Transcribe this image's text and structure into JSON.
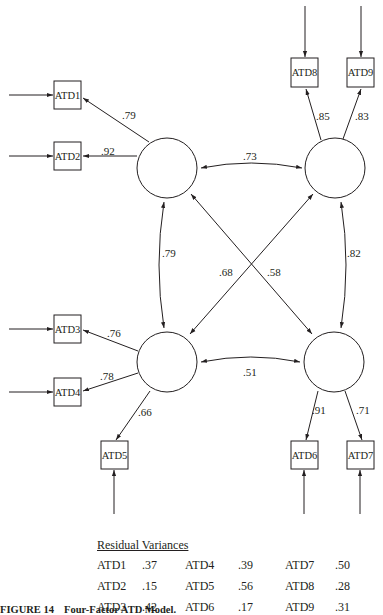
{
  "figure": {
    "number_label": "FIGURE 14",
    "title": "Four-Factor ATD Model."
  },
  "factors": [
    {
      "id": "F1",
      "position": "top-left"
    },
    {
      "id": "F2",
      "position": "top-right"
    },
    {
      "id": "F3",
      "position": "bottom-left"
    },
    {
      "id": "F4",
      "position": "bottom-right"
    }
  ],
  "indicators": [
    {
      "name": "ATD1",
      "factor": "F1",
      "loading": ".79"
    },
    {
      "name": "ATD2",
      "factor": "F1",
      "loading": ".92"
    },
    {
      "name": "ATD3",
      "factor": "F3",
      "loading": ".76"
    },
    {
      "name": "ATD4",
      "factor": "F3",
      "loading": ".78"
    },
    {
      "name": "ATD5",
      "factor": "F3",
      "loading": ".66"
    },
    {
      "name": "ATD6",
      "factor": "F4",
      "loading": ".91"
    },
    {
      "name": "ATD7",
      "factor": "F4",
      "loading": ".71"
    },
    {
      "name": "ATD8",
      "factor": "F2",
      "loading": ".85"
    },
    {
      "name": "ATD9",
      "factor": "F2",
      "loading": ".83"
    }
  ],
  "correlations": {
    "F1_F2": ".73",
    "F1_F3": ".79",
    "F2_F4": ".82",
    "F3_F4": ".51",
    "F2_F3": ".68",
    "F1_F4": ".58"
  },
  "residual_variances": {
    "title": "Residual Variances",
    "rows": [
      [
        {
          "name": "ATD1",
          "value": ".37"
        },
        {
          "name": "ATD4",
          "value": ".39"
        },
        {
          "name": "ATD7",
          "value": ".50"
        }
      ],
      [
        {
          "name": "ATD2",
          "value": ".15"
        },
        {
          "name": "ATD5",
          "value": ".56"
        },
        {
          "name": "ATD8",
          "value": ".28"
        }
      ],
      [
        {
          "name": "ATD3",
          "value": ".42"
        },
        {
          "name": "ATD6",
          "value": ".17"
        },
        {
          "name": "ATD9",
          "value": ".31"
        }
      ]
    ]
  }
}
